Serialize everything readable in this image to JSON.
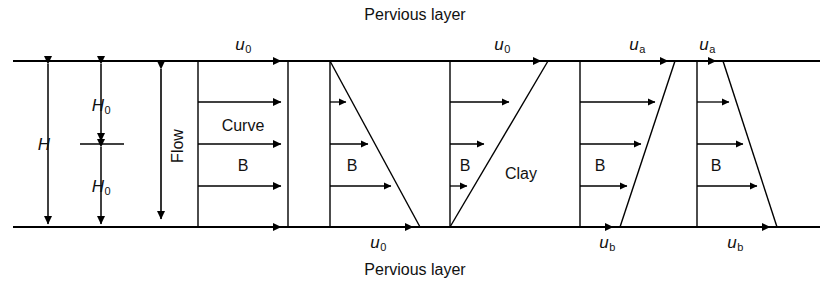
{
  "figure": {
    "top_boundary_label": "Pervious layer",
    "bottom_boundary_label": "Pervious layer",
    "geometry": {
      "top_line_y": 61,
      "bottom_line_y": 227,
      "line_x_start": 13,
      "line_x_end": 820,
      "stroke_color": "#000000"
    },
    "dimensions": [
      {
        "name": "total-thickness",
        "label": "H",
        "subscript": "",
        "x": 48,
        "y": 144,
        "from_y": 61,
        "to_y": 227
      },
      {
        "name": "half-thickness-upper",
        "label": "H",
        "subscript": "0",
        "x": 101,
        "y": 103,
        "from_y": 61,
        "to_y": 144
      },
      {
        "name": "half-thickness-lower",
        "label": "H",
        "subscript": "0",
        "x": 101,
        "y": 186,
        "from_y": 144,
        "to_y": 227
      }
    ],
    "flow_arrow": {
      "label": "Flow",
      "x": 161,
      "from_y": 66,
      "to_y": 222
    },
    "blocks": [
      {
        "name": "block-initial-uniform",
        "shape": "rectangle",
        "left_x": 198,
        "top_width": 90,
        "bottom_width": 90,
        "inner_labels": [
          "Curve",
          "B"
        ],
        "top_label": "u",
        "top_sub": "0",
        "bottom_label": "u",
        "bottom_sub": "0",
        "top_label_x": 243,
        "bottom_label_x": 378,
        "arrow_count": 5
      },
      {
        "name": "block-decreasing-triangle",
        "shape": "triangle-widening-down",
        "left_x": 330,
        "top_width": 0,
        "bottom_width": 90,
        "inner_labels": [
          "B"
        ],
        "top_label": "",
        "bottom_label": "",
        "arrow_count": 4
      },
      {
        "name": "block-increasing-triangle",
        "shape": "triangle-widening-up",
        "left_x": 450,
        "top_width": 98,
        "bottom_width": 0,
        "inner_labels": [
          "B"
        ],
        "side_label": "Clay",
        "top_label": "u",
        "top_sub": "0",
        "top_label_x": 502,
        "arrow_count": 4
      },
      {
        "name": "block-trapezoid-top-wide",
        "shape": "trapezoid",
        "left_x": 580,
        "top_width": 95,
        "bottom_width": 40,
        "inner_labels": [
          "B"
        ],
        "top_label": "u",
        "top_sub": "a",
        "bottom_label": "u",
        "bottom_sub": "b",
        "top_label_x": 637,
        "bottom_label_x": 607,
        "arrow_count": 5
      },
      {
        "name": "block-trapezoid-bottom-wide",
        "shape": "trapezoid",
        "left_x": 697,
        "top_width": 26,
        "bottom_width": 80,
        "inner_labels": [
          "B"
        ],
        "top_label": "u",
        "top_sub": "a",
        "bottom_label": "u",
        "bottom_sub": "b",
        "top_label_x": 707,
        "bottom_label_x": 735,
        "arrow_count": 5
      }
    ],
    "text_labels": {
      "curve": "Curve",
      "b": "B",
      "clay": "Clay",
      "flow": "Flow",
      "h": "H",
      "h0_sub": "0",
      "u": "u",
      "sub_0": "0",
      "sub_a": "a",
      "sub_b": "b",
      "pervious_layer": "Pervious layer"
    }
  }
}
